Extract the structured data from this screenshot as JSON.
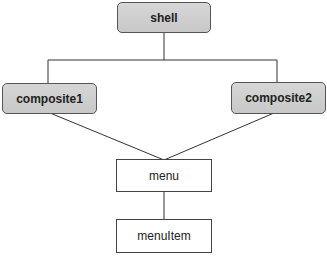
{
  "diagram": {
    "nodes": [
      {
        "id": "shell",
        "label": "shell",
        "style": "gray"
      },
      {
        "id": "composite1",
        "label": "composite1",
        "style": "gray"
      },
      {
        "id": "composite2",
        "label": "composite2",
        "style": "gray"
      },
      {
        "id": "menu",
        "label": "menu",
        "style": "white"
      },
      {
        "id": "menuItem",
        "label": "menuItem",
        "style": "white"
      }
    ],
    "edges": [
      {
        "from": "shell",
        "to": "composite1"
      },
      {
        "from": "shell",
        "to": "composite2"
      },
      {
        "from": "composite1",
        "to": "menu"
      },
      {
        "from": "composite2",
        "to": "menu"
      },
      {
        "from": "menu",
        "to": "menuItem"
      }
    ],
    "colors": {
      "gray_fill": "#cfcfcf",
      "border": "#444444",
      "line": "#333333"
    }
  }
}
